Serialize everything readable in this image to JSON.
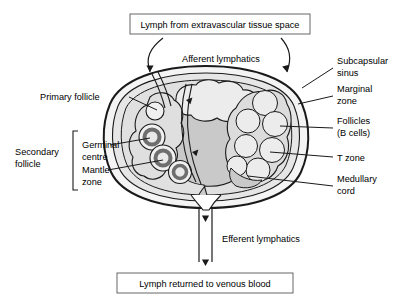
{
  "figure": {
    "background_color": "#ffffff",
    "line_color": "#1a1a1a"
  },
  "boxes": {
    "top": {
      "text": "Lymph from extravascular tissue space"
    },
    "bottom": {
      "text": "Lymph returned to venous blood"
    }
  },
  "flow_labels": {
    "afferent": "Afferent  lymphatics",
    "efferent": "Efferent lymphatics"
  },
  "left_labels": {
    "primary_follicle": "Primary follicle",
    "secondary_follicle_line1": "Secondary",
    "secondary_follicle_line2": "follicle",
    "germinal_line1": "Germinal",
    "germinal_line2": "centre",
    "mantle_line1": "Mantle",
    "mantle_line2": "zone"
  },
  "right_labels": {
    "subcapsular_line1": "Subcapsular",
    "subcapsular_line2": "sinus",
    "marginal_line1": "Marginal",
    "marginal_line2": "zone",
    "follicles_line1": "Follicles",
    "follicles_line2": "(B cells)",
    "tzone": "T zone",
    "medullary_line1": "Medullary",
    "medullary_line2": "cord"
  },
  "colors": {
    "capsule_fill": "#f2f2f2",
    "cortex_fill": "#e3e3e3",
    "follicle_fill": "#ebebeb",
    "medulla_fill": "#cfcfcf",
    "germinal_ring": "#6e6e6e",
    "germinal_core": "#e8e8e8",
    "outline": "#1a1a1a"
  },
  "structures": {
    "capsule": "outer double-line capsule enclosing node",
    "subcapsular_sinus": "space between capsule and cortex",
    "secondary_follicles_count": 3,
    "primary_follicles_count": 1,
    "right_follicle_lobules_count": 7,
    "medulla": "central darker grey region draining to hilum"
  }
}
